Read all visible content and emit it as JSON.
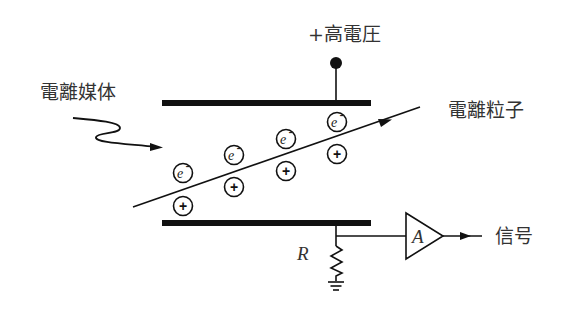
{
  "diagram": {
    "type": "ionization chamber schematic",
    "labels": {
      "high_voltage": "+高電圧",
      "ionizing_medium": "電離媒体",
      "ionized_particle": "電離粒子",
      "resistor": "R",
      "amplifier": "A",
      "signal": "信号"
    },
    "particles": {
      "electron_symbol": "e",
      "electron_charge": "-",
      "ion_symbol": "+"
    },
    "colors": {
      "stroke": "#111111",
      "text": "#333333",
      "background": "#ffffff"
    }
  }
}
